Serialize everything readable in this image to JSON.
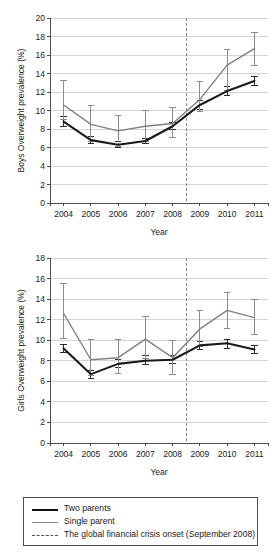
{
  "legend": {
    "items": [
      {
        "key": "two_parents",
        "label": "Two parents",
        "style": "solid-dark",
        "color": "#111111"
      },
      {
        "key": "single_parent",
        "label": "Single parent",
        "style": "solid-grey",
        "color": "#8a8a8a"
      },
      {
        "key": "crisis",
        "label": "The global financial crisis onset (September 2008)",
        "style": "dashed",
        "color": "#555555"
      }
    ]
  },
  "chart_data": [
    {
      "type": "line",
      "id": "boys",
      "title": "",
      "xlabel": "Year",
      "ylabel": "Boys Overweight prevalence (%)",
      "x": [
        2004,
        2005,
        2006,
        2007,
        2008,
        2009,
        2010,
        2011
      ],
      "categories": [
        "2004",
        "2005",
        "2006",
        "2007",
        "2008",
        "2009",
        "2010",
        "2011"
      ],
      "xlim": [
        2003.5,
        2011.5
      ],
      "ylim": [
        0,
        20
      ],
      "yticks": [
        0,
        2,
        4,
        6,
        8,
        10,
        12,
        14,
        16,
        18,
        20
      ],
      "grid": true,
      "legend_position": "below-figure",
      "annotations": [
        {
          "type": "vline",
          "x": 2008.5,
          "label": "The global financial crisis onset (September 2008)",
          "style": "dashed"
        }
      ],
      "series": [
        {
          "name": "Two parents",
          "color": "#111111",
          "values": [
            8.8,
            6.8,
            6.3,
            6.7,
            8.3,
            10.6,
            12.1,
            13.2
          ],
          "err_low": [
            8.3,
            6.4,
            6.0,
            6.4,
            7.9,
            10.1,
            11.6,
            12.7
          ],
          "err_high": [
            9.3,
            7.2,
            6.6,
            7.0,
            8.7,
            11.1,
            12.6,
            13.7
          ]
        },
        {
          "name": "Single parent",
          "color": "#8a8a8a",
          "values": [
            10.6,
            8.5,
            7.8,
            8.3,
            8.6,
            11.2,
            14.9,
            16.7
          ],
          "err_low": [
            9.0,
            6.6,
            6.1,
            6.6,
            7.1,
            9.9,
            12.2,
            14.9
          ],
          "err_high": [
            13.2,
            10.5,
            9.5,
            10.0,
            10.3,
            13.1,
            16.6,
            18.4
          ]
        }
      ]
    },
    {
      "type": "line",
      "id": "girls",
      "title": "",
      "xlabel": "Year",
      "ylabel": "Girls Overweight prevalence (%)",
      "x": [
        2004,
        2005,
        2006,
        2007,
        2008,
        2009,
        2010,
        2011
      ],
      "categories": [
        "2004",
        "2005",
        "2006",
        "2007",
        "2008",
        "2009",
        "2010",
        "2011"
      ],
      "xlim": [
        2003.5,
        2011.5
      ],
      "ylim": [
        0,
        18
      ],
      "yticks": [
        0,
        2,
        4,
        6,
        8,
        10,
        12,
        14,
        16,
        18
      ],
      "grid": true,
      "legend_position": "below-figure",
      "annotations": [
        {
          "type": "vline",
          "x": 2008.5,
          "label": "The global financial crisis onset (September 2008)",
          "style": "dashed"
        }
      ],
      "series": [
        {
          "name": "Two parents",
          "color": "#111111",
          "values": [
            9.2,
            6.7,
            7.7,
            8.0,
            8.1,
            9.5,
            9.7,
            9.1
          ],
          "err_low": [
            8.8,
            6.3,
            7.3,
            7.6,
            7.7,
            9.1,
            9.2,
            8.7
          ],
          "err_high": [
            9.6,
            7.1,
            8.1,
            8.5,
            8.5,
            9.9,
            10.1,
            9.5
          ]
        },
        {
          "name": "Single parent",
          "color": "#8a8a8a",
          "values": [
            12.6,
            8.1,
            8.3,
            10.1,
            8.3,
            11.1,
            12.9,
            12.2
          ],
          "err_low": [
            10.2,
            6.6,
            6.8,
            8.2,
            6.7,
            9.4,
            11.1,
            10.6
          ],
          "err_high": [
            15.5,
            10.1,
            10.1,
            12.3,
            10.0,
            12.9,
            14.6,
            14.0
          ]
        }
      ]
    }
  ]
}
